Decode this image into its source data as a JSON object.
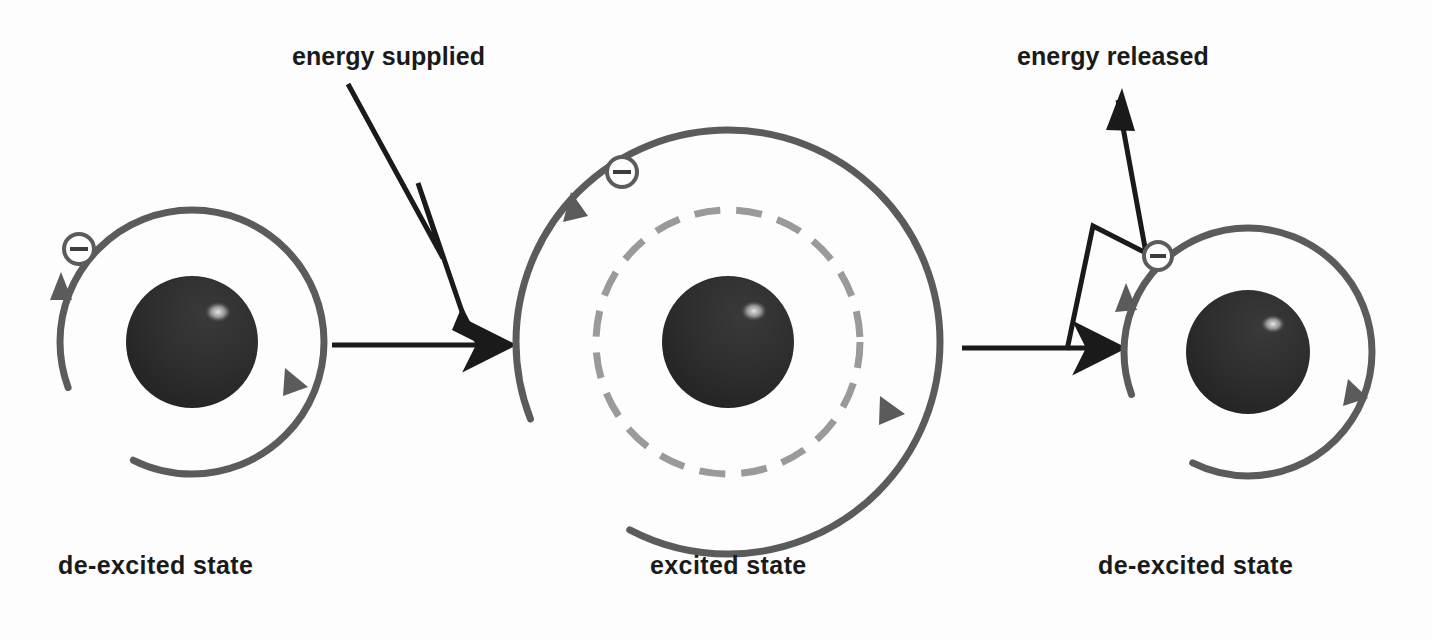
{
  "figure": {
    "background_color": "#fdfdfd"
  },
  "colors": {
    "nucleus": "#2b2b2b",
    "nucleus_highlight": "#e8e8e8",
    "orbit_solid": "#5b5b5b",
    "orbit_dashed": "#9a9a9a",
    "electron_stroke": "#5b5b5b",
    "arrow_black": "#1a1a1a",
    "text": "#1a1a1a"
  },
  "labels": {
    "energy_supplied": "energy supplied",
    "energy_released": "energy released",
    "state_left": "de-excited state",
    "state_middle": "excited state",
    "state_right": "de-excited state"
  },
  "icons": {
    "electron": "electron-minus-icon",
    "nucleus": "nucleus-icon",
    "orbit_solid": "orbit-solid-icon",
    "orbit_dashed": "orbit-dashed-icon",
    "lightning_down": "lightning-bolt-down-icon",
    "lightning_up": "lightning-bolt-up-icon",
    "transition_arrow": "transition-arrow-icon",
    "orbit_direction_arrow": "orbit-direction-arrowhead-icon"
  },
  "atoms": [
    {
      "id": "atom-left",
      "state": "de-excited state",
      "nucleus": {
        "cx": 192,
        "cy": 342,
        "r": 66
      },
      "orbits": [
        {
          "type": "solid",
          "r": 132,
          "electron_present": true
        }
      ],
      "electron": {
        "cx": 79,
        "cy": 249,
        "r": 15
      },
      "direction_arrows": 2
    },
    {
      "id": "atom-middle",
      "state": "excited state",
      "nucleus": {
        "cx": 728,
        "cy": 342,
        "r": 66
      },
      "orbits": [
        {
          "type": "dashed",
          "r": 132,
          "electron_present": false
        },
        {
          "type": "solid",
          "r": 212,
          "electron_present": true
        }
      ],
      "electron": {
        "cx": 622,
        "cy": 172,
        "r": 15
      },
      "direction_arrows": 2
    },
    {
      "id": "atom-right",
      "state": "de-excited state",
      "nucleus": {
        "cx": 1248,
        "cy": 352,
        "r": 62
      },
      "orbits": [
        {
          "type": "solid",
          "r": 124,
          "electron_present": true
        }
      ],
      "electron": {
        "cx": 1158,
        "cy": 256,
        "r": 14
      },
      "direction_arrows": 2
    }
  ],
  "transitions": [
    {
      "id": "transition-left-to-middle",
      "kind": "energy-in",
      "label": "energy supplied",
      "arrow": {
        "x1": 332,
        "y1": 345,
        "x2": 512,
        "y2": 345
      }
    },
    {
      "id": "transition-middle-to-right",
      "kind": "energy-out",
      "label": "energy released",
      "arrow": {
        "x1": 962,
        "y1": 348,
        "x2": 1122,
        "y2": 348
      }
    }
  ]
}
